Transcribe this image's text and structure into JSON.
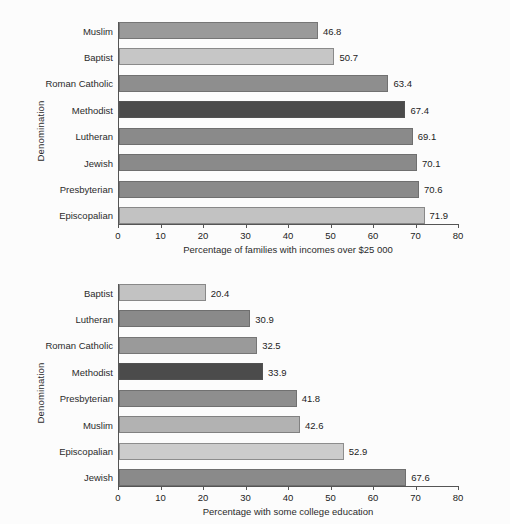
{
  "chart_data": [
    {
      "type": "bar",
      "orientation": "horizontal",
      "id": "income-chart",
      "title": "",
      "xlabel": "Percentage of families with incomes over $25 000",
      "ylabel": "Denomination",
      "xlim": [
        0,
        80
      ],
      "xticks": [
        0,
        10,
        20,
        30,
        40,
        50,
        60,
        70,
        80
      ],
      "xtick_labels": [
        "0",
        "10",
        "20",
        "30",
        "40",
        "50",
        "60",
        "70",
        "80"
      ],
      "grid": false,
      "legend": "none",
      "categories": [
        "Muslim",
        "Baptist",
        "Roman Catholic",
        "Methodist",
        "Lutheran",
        "Jewish",
        "Presbyterian",
        "Episcopalian"
      ],
      "values": [
        46.8,
        50.7,
        63.4,
        67.4,
        69.1,
        70.1,
        70.6,
        71.9
      ],
      "value_labels": [
        "46.8",
        "50.7",
        "63.4",
        "67.4",
        "69.1",
        "70.1",
        "70.6",
        "71.9"
      ],
      "bar_colors": [
        "#9a9a9a",
        "#c6c6c6",
        "#8e8e8e",
        "#4b4b4b",
        "#8a8a8a",
        "#8a8a8a",
        "#8a8a8a",
        "#c2c2c2"
      ]
    },
    {
      "type": "bar",
      "orientation": "horizontal",
      "id": "college-chart",
      "title": "",
      "xlabel": "Percentage with some college education",
      "ylabel": "Denomination",
      "xlim": [
        0,
        80
      ],
      "xticks": [
        0,
        10,
        20,
        30,
        40,
        50,
        60,
        70,
        80
      ],
      "xtick_labels": [
        "0",
        "10",
        "20",
        "30",
        "40",
        "50",
        "60",
        "70",
        "80"
      ],
      "grid": false,
      "legend": "none",
      "categories": [
        "Baptist",
        "Lutheran",
        "Roman Catholic",
        "Methodist",
        "Presbyterian",
        "Muslim",
        "Episcopalian",
        "Jewish"
      ],
      "values": [
        20.4,
        30.9,
        32.5,
        33.9,
        41.8,
        42.6,
        52.9,
        67.6
      ],
      "value_labels": [
        "20.4",
        "30.9",
        "32.5",
        "33.9",
        "41.8",
        "42.6",
        "52.9",
        "67.6"
      ],
      "bar_colors": [
        "#c2c2c2",
        "#8a8a8a",
        "#9a9a9a",
        "#4b4b4b",
        "#8e8e8e",
        "#b2b2b2",
        "#cccccc",
        "#8a8a8a"
      ]
    }
  ]
}
